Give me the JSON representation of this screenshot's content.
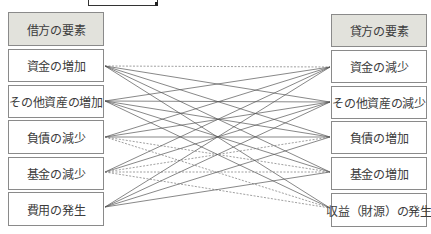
{
  "diagram": {
    "left_header": "借方の要素",
    "right_header": "貸方の要素",
    "left_items": [
      "資金の増加",
      "その他資産の増加",
      "負債の減少",
      "基金の減少",
      "費用の発生"
    ],
    "right_items": [
      "資金の減少",
      "その他資産の減少",
      "負債の増加",
      "基金の増加",
      "収益（財源）の発生"
    ],
    "connections": [
      {
        "from": 0,
        "to": 0,
        "style": "dashed"
      },
      {
        "from": 0,
        "to": 1,
        "style": "solid"
      },
      {
        "from": 0,
        "to": 2,
        "style": "solid"
      },
      {
        "from": 0,
        "to": 3,
        "style": "solid"
      },
      {
        "from": 0,
        "to": 4,
        "style": "solid"
      },
      {
        "from": 1,
        "to": 0,
        "style": "solid"
      },
      {
        "from": 1,
        "to": 1,
        "style": "solid"
      },
      {
        "from": 1,
        "to": 2,
        "style": "solid"
      },
      {
        "from": 1,
        "to": 3,
        "style": "solid"
      },
      {
        "from": 1,
        "to": 4,
        "style": "solid"
      },
      {
        "from": 2,
        "to": 0,
        "style": "solid"
      },
      {
        "from": 2,
        "to": 1,
        "style": "solid"
      },
      {
        "from": 2,
        "to": 2,
        "style": "solid"
      },
      {
        "from": 2,
        "to": 3,
        "style": "dashed"
      },
      {
        "from": 2,
        "to": 4,
        "style": "dashed"
      },
      {
        "from": 3,
        "to": 0,
        "style": "solid"
      },
      {
        "from": 3,
        "to": 1,
        "style": "solid"
      },
      {
        "from": 3,
        "to": 2,
        "style": "dashed"
      },
      {
        "from": 3,
        "to": 3,
        "style": "dashed"
      },
      {
        "from": 3,
        "to": 4,
        "style": "dashed"
      },
      {
        "from": 4,
        "to": 0,
        "style": "solid"
      },
      {
        "from": 4,
        "to": 1,
        "style": "solid"
      },
      {
        "from": 4,
        "to": 2,
        "style": "solid"
      },
      {
        "from": 4,
        "to": 3,
        "style": "solid"
      }
    ],
    "colors": {
      "header_bg": "#e2e2dc",
      "box_border": "#8a8a8a",
      "line": "#555555"
    }
  }
}
